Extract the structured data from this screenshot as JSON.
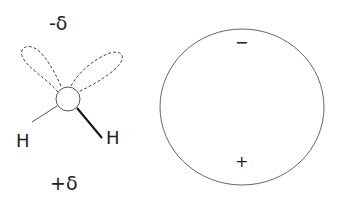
{
  "molecule": {
    "partial_charge_top": "-δ",
    "partial_charge_bottom": "+δ",
    "atom_left": "H",
    "atom_right": "H"
  },
  "dipole_circle": {
    "top_sign": "−",
    "bottom_sign": "+"
  }
}
